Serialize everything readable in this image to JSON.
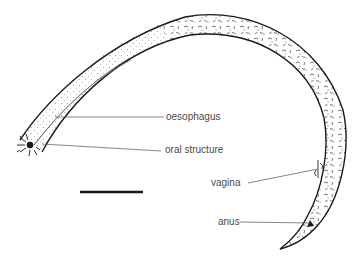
{
  "figure": {
    "labels": [
      {
        "id": "oesophagus",
        "text": "oesophagus"
      },
      {
        "id": "oral-structure",
        "text": "oral structure"
      },
      {
        "id": "vagina",
        "text": "vagina"
      },
      {
        "id": "anus",
        "text": "anus"
      }
    ],
    "scale_bar": {
      "label": ""
    },
    "colors": {
      "outline": "#1a1a1a",
      "leader_line": "#555555",
      "label_text": "#4a4a4a",
      "background": "#ffffff"
    }
  }
}
